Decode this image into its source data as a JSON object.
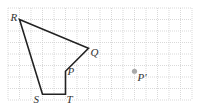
{
  "diagram": {
    "grid": {
      "x0": 8,
      "y0": 8,
      "cell": 11.5,
      "cols": 16,
      "rows": 8,
      "line_color": "#cfcfcf"
    },
    "polygon": {
      "name": "PQRST",
      "vertices": [
        {
          "label": "R",
          "gx": 1,
          "gy": 1
        },
        {
          "label": "Q",
          "gx": 7,
          "gy": 3.5
        },
        {
          "label": "P",
          "gx": 5,
          "gy": 5.5
        },
        {
          "label": "T",
          "gx": 5,
          "gy": 7.5
        },
        {
          "label": "S",
          "gx": 3,
          "gy": 7.5
        }
      ],
      "stroke": "#222222"
    },
    "labels": {
      "R": "R",
      "Q": "Q",
      "P": "P",
      "S": "S",
      "T": "T",
      "P_prime": "P′"
    },
    "point_P_prime": {
      "gx": 11,
      "gy": 5.5,
      "color": "#aaaaaa"
    }
  }
}
